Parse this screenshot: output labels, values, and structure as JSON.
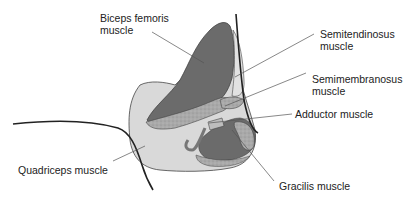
{
  "diagram": {
    "labels": {
      "biceps_femoris": [
        "Biceps femoris",
        "muscle"
      ],
      "semitendinosus": [
        "Semitendinosus",
        "muscle"
      ],
      "semimembranosus": [
        "Semimembranosus",
        "muscle"
      ],
      "adductor": [
        "Adductor muscle"
      ],
      "quadriceps": [
        "Quadriceps muscle"
      ],
      "gracilis": [
        "Gracilis muscle"
      ]
    },
    "colors": {
      "dark_muscle": "#6e6e6e",
      "light_muscle": "#d9d9d9",
      "speckled": "#a8a8a8",
      "outline": "#333333",
      "leader_line": "#555555"
    }
  }
}
